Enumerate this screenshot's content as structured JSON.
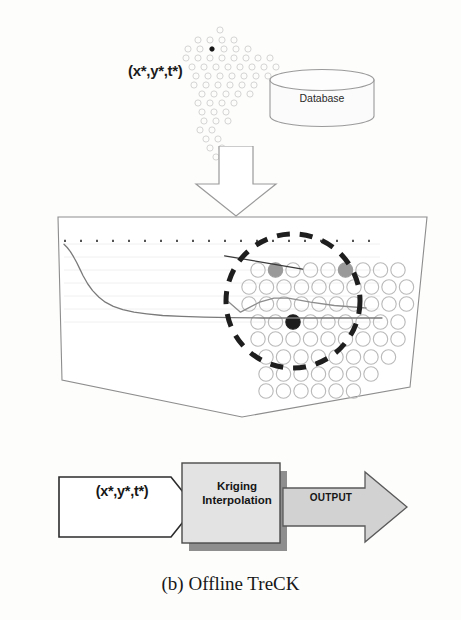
{
  "figure": {
    "caption": "(b) Offline TreCK",
    "background_color": "#fdfdfc"
  },
  "top_section": {
    "query_label": "(x*,y*,t*)",
    "dot_cloud": {
      "name": "scattered-sample-points",
      "open_circle_color": "#cfcfcf",
      "highlight_dot_color": "#151515",
      "highlight_index": 7,
      "points": [
        [
          52,
          4
        ],
        [
          30,
          14
        ],
        [
          42,
          14
        ],
        [
          54,
          14
        ],
        [
          66,
          14
        ],
        [
          20,
          23
        ],
        [
          32,
          23
        ],
        [
          44,
          23
        ],
        [
          56,
          23
        ],
        [
          68,
          23
        ],
        [
          80,
          23
        ],
        [
          18,
          32
        ],
        [
          30,
          32
        ],
        [
          42,
          32
        ],
        [
          54,
          32
        ],
        [
          66,
          32
        ],
        [
          78,
          32
        ],
        [
          90,
          32
        ],
        [
          102,
          32
        ],
        [
          24,
          41
        ],
        [
          36,
          41
        ],
        [
          48,
          41
        ],
        [
          60,
          41
        ],
        [
          72,
          41
        ],
        [
          84,
          41
        ],
        [
          96,
          41
        ],
        [
          108,
          41
        ],
        [
          28,
          50
        ],
        [
          40,
          50
        ],
        [
          52,
          50
        ],
        [
          64,
          50
        ],
        [
          76,
          50
        ],
        [
          88,
          50
        ],
        [
          100,
          50
        ],
        [
          26,
          59
        ],
        [
          38,
          59
        ],
        [
          50,
          59
        ],
        [
          62,
          59
        ],
        [
          74,
          59
        ],
        [
          86,
          59
        ],
        [
          34,
          68
        ],
        [
          46,
          68
        ],
        [
          58,
          68
        ],
        [
          70,
          68
        ],
        [
          82,
          68
        ],
        [
          30,
          77
        ],
        [
          42,
          77
        ],
        [
          54,
          77
        ],
        [
          66,
          77
        ],
        [
          34,
          86
        ],
        [
          46,
          86
        ],
        [
          58,
          86
        ],
        [
          36,
          95
        ],
        [
          48,
          95
        ],
        [
          60,
          95
        ],
        [
          32,
          104
        ],
        [
          44,
          104
        ],
        [
          38,
          113
        ],
        [
          50,
          113
        ],
        [
          42,
          122
        ],
        [
          54,
          122
        ],
        [
          48,
          131
        ]
      ]
    },
    "database": {
      "label": "Database",
      "fill_color": "#fbfbfb",
      "stroke_color": "#9a9a9a"
    },
    "down_arrow": {
      "name": "flow-arrow-down",
      "stroke_color": "#9a9a9a",
      "fill_color": "#ffffff"
    }
  },
  "main_panel": {
    "name": "data-surface-panel",
    "outline_color": "#8d8d8d",
    "fill_color": "#ffffff",
    "magnifier": {
      "name": "magnifier-circle",
      "stroke_color": "#1e1e1e",
      "center": [
        243,
        89
      ],
      "radius": 67,
      "dash": "13 10",
      "stroke_width": 5
    },
    "grid_circles": {
      "open_color": "#b9b9b9",
      "gray_fill_color": "#9a9a9a",
      "dark_fill_color": "#1d1d1d",
      "radius": 7.2,
      "rows": [
        {
          "y": 58,
          "x_start": 208,
          "count": 9,
          "spacing": 17.5,
          "filled": [
            1,
            5
          ],
          "fill_type": "gray"
        },
        {
          "y": 75,
          "x_start": 199,
          "count": 10,
          "spacing": 17.5,
          "filled": [],
          "fill_type": "gray"
        },
        {
          "y": 92,
          "x_start": 199,
          "count": 10,
          "spacing": 17.5,
          "filled": [],
          "fill_type": "gray"
        },
        {
          "y": 110,
          "x_start": 208,
          "count": 9,
          "spacing": 17.5,
          "filled": [
            2
          ],
          "fill_type": "dark"
        },
        {
          "y": 127,
          "x_start": 208,
          "count": 9,
          "spacing": 17.5,
          "filled": [],
          "fill_type": "gray"
        },
        {
          "y": 145,
          "x_start": 216,
          "count": 8,
          "spacing": 17.5,
          "filled": [],
          "fill_type": "gray"
        },
        {
          "y": 162,
          "x_start": 216,
          "count": 7,
          "spacing": 17.5,
          "filled": [],
          "fill_type": "gray"
        },
        {
          "y": 179,
          "x_start": 216,
          "count": 6,
          "spacing": 17.5,
          "filled": [],
          "fill_type": "gray"
        }
      ]
    },
    "chart_data": {
      "type": "line",
      "title": "",
      "xlabel": "",
      "ylabel": "",
      "grid": true,
      "legend_position": "none",
      "axis_color": "#c8c8c8",
      "series": [
        {
          "name": "sigmoid-trend-curve",
          "color": "#7a7a7a",
          "style": "solid",
          "x": [
            0,
            4,
            8,
            12,
            16,
            20,
            24,
            30,
            36,
            44,
            52,
            62,
            74,
            88,
            104,
            124,
            148,
            176,
            210,
            250,
            300,
            350,
            400
          ],
          "y": [
            118,
            114,
            109,
            103,
            96,
            88,
            80,
            70,
            62,
            54,
            48,
            43,
            39,
            36,
            34,
            32,
            31,
            30,
            29.5,
            29,
            29,
            29,
            29
          ]
        },
        {
          "name": "baseline-dotted-axis",
          "color": "#555555",
          "style": "dotted",
          "x": [
            0,
            400
          ],
          "y": [
            122,
            122
          ]
        },
        {
          "name": "magnified-inset-trend",
          "color": "#8c8c8c",
          "style": "solid",
          "x": [
            205,
            222,
            246,
            264,
            282,
            310,
            340,
            380
          ],
          "y": [
            50,
            36,
            48,
            53,
            53,
            48,
            44,
            41
          ]
        },
        {
          "name": "magnified-inset-slope",
          "color": "#3a3a3a",
          "style": "solid",
          "x": [
            202,
            300
          ],
          "y": [
            104,
            88
          ]
        }
      ],
      "xlim": [
        0,
        400
      ],
      "ylim": [
        0,
        140
      ]
    }
  },
  "pipeline": {
    "input_arrow": {
      "name": "query-input-arrow",
      "label": "(x*,y*,t*)",
      "fill_color": "#ffffff",
      "stroke_color": "#2b2b2b"
    },
    "process_box": {
      "name": "kriging-interpolation-box",
      "label_line1": "Kriging",
      "label_line2": "Interpolation",
      "fill_color": "#e3e3e3",
      "stroke_color": "#4a4a4a",
      "shadow_color": "#8e8e8e"
    },
    "output_arrow": {
      "name": "output-arrow",
      "label": "OUTPUT",
      "fill_color": "#d2d2d2",
      "stroke_color": "#5a5a5a"
    }
  }
}
